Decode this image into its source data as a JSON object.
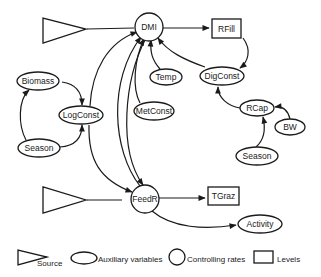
{
  "diagram": {
    "nodes": {
      "source_top": {
        "type": "source"
      },
      "source_bottom": {
        "type": "source"
      },
      "dmi": {
        "label": "DMI",
        "type": "controlling_rate"
      },
      "rfill": {
        "label": "RFill",
        "type": "level"
      },
      "temp": {
        "label": "Temp",
        "type": "auxiliary"
      },
      "digconst": {
        "label": "DigConst",
        "type": "auxiliary"
      },
      "metconst": {
        "label": "MetConst",
        "type": "auxiliary"
      },
      "biomass": {
        "label": "Biomass",
        "type": "auxiliary"
      },
      "logconst": {
        "label": "LogConst",
        "type": "auxiliary"
      },
      "season_left": {
        "label": "Season",
        "type": "auxiliary"
      },
      "rcap": {
        "label": "RCap",
        "type": "auxiliary"
      },
      "bw": {
        "label": "BW",
        "type": "auxiliary"
      },
      "season_right": {
        "label": "Season",
        "type": "auxiliary"
      },
      "feedr": {
        "label": "FeedR",
        "type": "controlling_rate"
      },
      "tgraz": {
        "label": "TGraz",
        "type": "level"
      },
      "activity": {
        "label": "Activity",
        "type": "auxiliary"
      }
    },
    "edges": [
      {
        "from": "source_top",
        "to": "dmi"
      },
      {
        "from": "dmi",
        "to": "rfill"
      },
      {
        "from": "rfill",
        "to": "digconst"
      },
      {
        "from": "digconst",
        "to": "dmi"
      },
      {
        "from": "temp",
        "to": "dmi"
      },
      {
        "from": "metconst",
        "to": "dmi"
      },
      {
        "from": "logconst",
        "to": "dmi"
      },
      {
        "from": "feedr",
        "to": "dmi"
      },
      {
        "from": "dmi",
        "to": "feedr"
      },
      {
        "from": "logconst",
        "to": "feedr"
      },
      {
        "from": "biomass",
        "to": "logconst"
      },
      {
        "from": "season_left",
        "to": "logconst"
      },
      {
        "from": "season_left",
        "to": "biomass"
      },
      {
        "from": "rcap",
        "to": "digconst"
      },
      {
        "from": "bw",
        "to": "rcap"
      },
      {
        "from": "season_right",
        "to": "rcap"
      },
      {
        "from": "source_bottom",
        "to": "feedr"
      },
      {
        "from": "feedr",
        "to": "tgraz"
      },
      {
        "from": "feedr",
        "to": "activity"
      }
    ]
  },
  "legend": {
    "source": "Source",
    "auxiliary": "Auxiliary variables",
    "controlling": "Controlling rates",
    "levels": "Levels"
  }
}
